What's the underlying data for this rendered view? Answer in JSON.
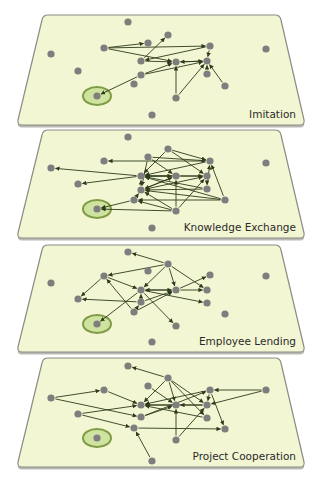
{
  "colors": {
    "panel_fill": "#f3f6d3",
    "panel_stroke": "#8c8c84",
    "panel_shadow": "#b9b9b4",
    "node": "#7e7e7e",
    "edge": "#2e3a1c",
    "focal_fill": "#cfe3a0",
    "focal_stroke": "#7f9c45"
  },
  "panels": [
    {
      "label": "Imitation",
      "top": 15,
      "bottom": 125,
      "nodes": [
        [
          104,
          48
        ],
        [
          148,
          43
        ],
        [
          168,
          35
        ],
        [
          210,
          46
        ],
        [
          141,
          61
        ],
        [
          176,
          62
        ],
        [
          207,
          61
        ],
        [
          141,
          75
        ],
        [
          134,
          84
        ],
        [
          207,
          74
        ],
        [
          176,
          98
        ],
        [
          225,
          86
        ],
        [
          97,
          96
        ],
        [
          128,
          22
        ],
        [
          51,
          54
        ],
        [
          78,
          71
        ],
        [
          266,
          49
        ],
        [
          152,
          115
        ]
      ],
      "focal": 12,
      "edges": [
        [
          0,
          1
        ],
        [
          0,
          3
        ],
        [
          0,
          5
        ],
        [
          4,
          2
        ],
        [
          4,
          5
        ],
        [
          3,
          4
        ],
        [
          6,
          5
        ],
        [
          5,
          6
        ],
        [
          3,
          6
        ],
        [
          9,
          6
        ],
        [
          10,
          5
        ],
        [
          10,
          6
        ],
        [
          11,
          6
        ],
        [
          7,
          5
        ],
        [
          7,
          6
        ],
        [
          7,
          12
        ]
      ]
    },
    {
      "label": "Knowledge Exchange",
      "top": 130,
      "bottom": 238,
      "nodes": [
        [
          104,
          161
        ],
        [
          148,
          157
        ],
        [
          168,
          149
        ],
        [
          210,
          161
        ],
        [
          141,
          176
        ],
        [
          176,
          176
        ],
        [
          207,
          176
        ],
        [
          141,
          190
        ],
        [
          134,
          200
        ],
        [
          207,
          189
        ],
        [
          225,
          200
        ],
        [
          176,
          211
        ],
        [
          97,
          209
        ],
        [
          128,
          137
        ],
        [
          51,
          168
        ],
        [
          78,
          184
        ],
        [
          266,
          163
        ],
        [
          152,
          228
        ]
      ],
      "focal": 12,
      "edges": [
        [
          1,
          3
        ],
        [
          1,
          5
        ],
        [
          2,
          3
        ],
        [
          2,
          4
        ],
        [
          2,
          6
        ],
        [
          3,
          0
        ],
        [
          3,
          4
        ],
        [
          4,
          5
        ],
        [
          5,
          4
        ],
        [
          5,
          6
        ],
        [
          6,
          4
        ],
        [
          4,
          15
        ],
        [
          4,
          14
        ],
        [
          7,
          4
        ],
        [
          7,
          5
        ],
        [
          7,
          6
        ],
        [
          9,
          7
        ],
        [
          9,
          4
        ],
        [
          10,
          4
        ],
        [
          10,
          7
        ],
        [
          10,
          8
        ],
        [
          10,
          3
        ],
        [
          11,
          8
        ],
        [
          11,
          7
        ],
        [
          11,
          5
        ],
        [
          11,
          12
        ],
        [
          11,
          6
        ],
        [
          8,
          12
        ],
        [
          6,
          9
        ],
        [
          9,
          3
        ],
        [
          5,
          7
        ],
        [
          8,
          7
        ],
        [
          1,
          7
        ]
      ]
    },
    {
      "label": "Employee Lending",
      "top": 245,
      "bottom": 352,
      "nodes": [
        [
          128,
          252
        ],
        [
          168,
          264
        ],
        [
          148,
          271
        ],
        [
          104,
          276
        ],
        [
          210,
          275
        ],
        [
          141,
          290
        ],
        [
          176,
          290
        ],
        [
          207,
          290
        ],
        [
          78,
          299
        ],
        [
          141,
          302
        ],
        [
          207,
          303
        ],
        [
          134,
          312
        ],
        [
          225,
          314
        ],
        [
          176,
          326
        ],
        [
          97,
          324
        ],
        [
          51,
          283
        ],
        [
          266,
          276
        ],
        [
          152,
          342
        ]
      ],
      "focal": 14,
      "edges": [
        [
          1,
          0
        ],
        [
          1,
          3
        ],
        [
          1,
          5
        ],
        [
          1,
          6
        ],
        [
          1,
          7
        ],
        [
          3,
          8
        ],
        [
          3,
          5
        ],
        [
          5,
          6
        ],
        [
          6,
          5
        ],
        [
          6,
          7
        ],
        [
          5,
          10
        ],
        [
          6,
          4
        ],
        [
          9,
          8
        ],
        [
          9,
          5
        ],
        [
          9,
          6
        ],
        [
          11,
          9
        ],
        [
          11,
          3
        ],
        [
          11,
          6
        ],
        [
          5,
          13
        ],
        [
          5,
          14
        ]
      ]
    },
    {
      "label": "Project Cooperation",
      "top": 358,
      "bottom": 467,
      "nodes": [
        [
          128,
          366
        ],
        [
          168,
          378
        ],
        [
          148,
          386
        ],
        [
          104,
          390
        ],
        [
          51,
          398
        ],
        [
          210,
          390
        ],
        [
          266,
          390
        ],
        [
          141,
          405
        ],
        [
          176,
          405
        ],
        [
          207,
          405
        ],
        [
          78,
          414
        ],
        [
          141,
          417
        ],
        [
          207,
          418
        ],
        [
          134,
          428
        ],
        [
          225,
          429
        ],
        [
          176,
          440
        ],
        [
          97,
          438
        ],
        [
          152,
          461
        ]
      ],
      "focal": 16,
      "edges": [
        [
          1,
          0
        ],
        [
          1,
          7
        ],
        [
          1,
          8
        ],
        [
          1,
          9
        ],
        [
          1,
          12
        ],
        [
          4,
          3
        ],
        [
          4,
          11
        ],
        [
          3,
          7
        ],
        [
          2,
          8
        ],
        [
          5,
          7
        ],
        [
          5,
          9
        ],
        [
          6,
          5
        ],
        [
          6,
          9
        ],
        [
          8,
          7
        ],
        [
          9,
          7
        ],
        [
          9,
          8
        ],
        [
          10,
          7
        ],
        [
          10,
          13
        ],
        [
          11,
          8
        ],
        [
          11,
          5
        ],
        [
          13,
          14
        ],
        [
          15,
          8
        ],
        [
          15,
          9
        ],
        [
          17,
          13
        ],
        [
          12,
          7
        ],
        [
          5,
          14
        ]
      ]
    }
  ]
}
